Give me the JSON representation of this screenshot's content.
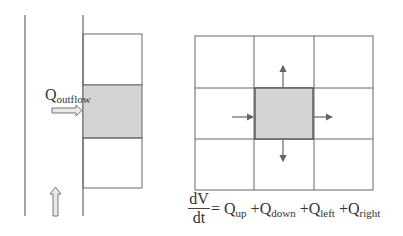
{
  "left_diagram": {
    "outflow_label_main": "Q",
    "outflow_label_sub": "outflow",
    "shaded_color": "#d4d4d4",
    "line_color": "#666666"
  },
  "right_diagram": {
    "grid_rows": 3,
    "grid_cols": 3,
    "center_shaded_color": "#d4d4d4",
    "arrows": [
      "up",
      "down",
      "left-in",
      "right-out"
    ]
  },
  "equation": {
    "numerator": "dV",
    "denominator": "dt",
    "equals": "=",
    "terms": [
      {
        "main": "Q",
        "sub": "up"
      },
      {
        "main": "Q",
        "sub": "down"
      },
      {
        "main": "Q",
        "sub": "left"
      },
      {
        "main": "Q",
        "sub": "right"
      }
    ],
    "plus": "+"
  }
}
